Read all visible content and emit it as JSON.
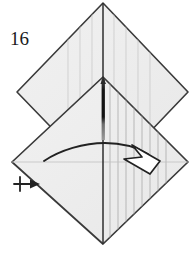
{
  "figure": {
    "kind": "origami-fold-diagram",
    "step_number": "16",
    "width": 195,
    "height": 258,
    "background_color": "#ffffff"
  },
  "colors": {
    "paper_fill": "#eeeeee",
    "paper_fill_light": "#f2f2f2",
    "edge_stroke": "#3a3a3a",
    "crease_stroke": "#b9b9b9",
    "pleat_stroke": "#a9a9a9",
    "dark_band": "#141414",
    "gray_band": "#8c8c8c",
    "arrow_stroke": "#222222",
    "text_color": "#1a1a1a"
  },
  "shapes": {
    "upper_diamond": {
      "name": "upper-square-panel",
      "points": "103,3 188,92 103,181 17,92"
    },
    "lower_diamond": {
      "name": "lower-square-panel",
      "points": "103,77 188,162 103,244 12,162"
    }
  },
  "creases": {
    "center_vertical": {
      "x": 103,
      "y1": 3,
      "y2": 244
    },
    "horizontal_middle": {
      "y": 162,
      "x1": 12,
      "x2": 188
    },
    "upper_left_diag": "17,92 103,181",
    "upper_right_diag": "188,92 103,181"
  },
  "pleats": {
    "label": "pleat-lines",
    "count": 8,
    "lower_right_x": [
      110,
      118,
      126,
      134,
      142,
      150,
      158,
      166
    ],
    "upper_left_x": [
      68,
      80,
      92
    ],
    "upper_right_x": [
      114,
      126,
      138
    ]
  },
  "dark_spike": {
    "name": "dark-pleat-spike",
    "x": 101.5,
    "top": 79,
    "dark_bottom": 122,
    "gray_bottom": 140,
    "width": 3.4
  },
  "curved_arrow": {
    "name": "fold-direction-arrow",
    "path": "M 44,161 C 60,150 84,143 105,143 C 124,143 138,148 148,154",
    "head_points": "158,159 133,146 142,156 126,158 150,172",
    "head_fill": "#ffffff"
  },
  "push_arrow": {
    "name": "push-here-arrow",
    "label": "push",
    "shaft": {
      "x1": 14,
      "y1": 184,
      "x2": 34,
      "y2": 184
    },
    "cross": {
      "x": 21,
      "y1": 177,
      "y2": 191
    },
    "head": "40,184 31,180 31,188"
  },
  "labels": {
    "step_number": {
      "text": "16",
      "x": 10,
      "y": 45
    }
  }
}
